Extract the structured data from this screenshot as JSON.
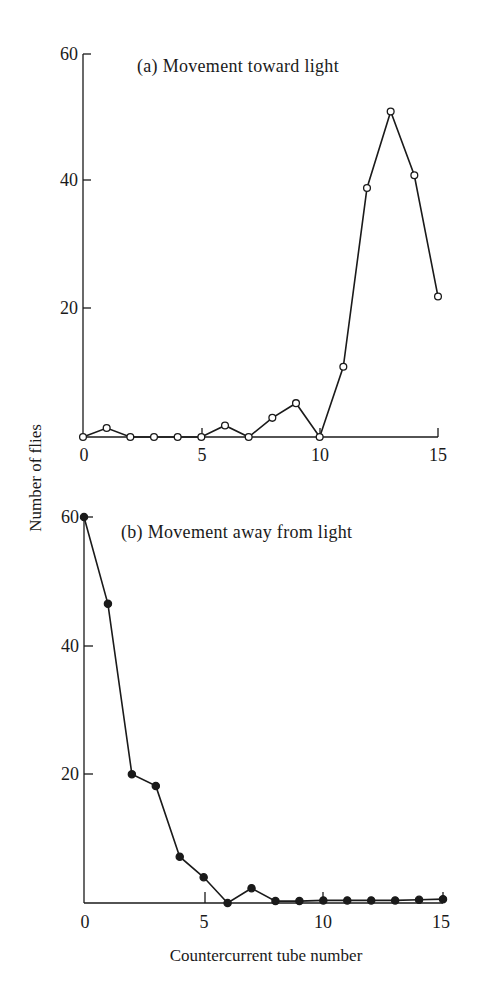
{
  "figure": {
    "ylabel": "Number of flies",
    "xlabel": "Countercurrent tube number",
    "panels": [
      {
        "title": "(a) Movement toward light",
        "marker": "open-circle",
        "yticks": [
          "60",
          "40",
          "20"
        ],
        "xticks": [
          "0",
          "5",
          "10",
          "15"
        ]
      },
      {
        "title": "(b) Movement away from light",
        "marker": "filled-circle",
        "yticks": [
          "60",
          "40",
          "20"
        ],
        "xticks": [
          "0",
          "5",
          "10",
          "15"
        ]
      }
    ]
  },
  "chart_data": [
    {
      "type": "line",
      "title": "(a) Movement toward light",
      "xlabel": "Countercurrent tube number",
      "ylabel": "Number of flies",
      "x": [
        0,
        1,
        2,
        3,
        4,
        5,
        6,
        7,
        8,
        9,
        10,
        11,
        12,
        13,
        14,
        15
      ],
      "series": [
        {
          "name": "Movement toward light",
          "marker": "open circle",
          "values": [
            0,
            1.4,
            0,
            0,
            0,
            0,
            1.8,
            0,
            3,
            5.3,
            0,
            11,
            39,
            51,
            41,
            22
          ]
        }
      ],
      "xlim": [
        0,
        15
      ],
      "ylim": [
        0,
        60
      ],
      "xticks": [
        0,
        5,
        10,
        15
      ],
      "yticks": [
        20,
        40,
        60
      ],
      "grid": false,
      "legend": "none"
    },
    {
      "type": "line",
      "title": "(b) Movement away from light",
      "xlabel": "Countercurrent tube number",
      "ylabel": "Number of flies",
      "x": [
        0,
        1,
        2,
        3,
        4,
        5,
        6,
        7,
        8,
        9,
        10,
        11,
        12,
        13,
        14,
        15
      ],
      "series": [
        {
          "name": "Movement away from light",
          "marker": "filled circle",
          "values": [
            60,
            46.5,
            20,
            18.2,
            7.2,
            4,
            0,
            2.3,
            0.3,
            0.3,
            0.4,
            0.4,
            0.4,
            0.4,
            0.5,
            0.6
          ]
        }
      ],
      "xlim": [
        0,
        15
      ],
      "ylim": [
        0,
        60
      ],
      "xticks": [
        0,
        5,
        10,
        15
      ],
      "yticks": [
        20,
        40,
        60
      ],
      "grid": false,
      "legend": "none"
    }
  ]
}
